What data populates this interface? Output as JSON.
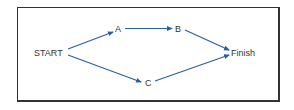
{
  "diagram": {
    "type": "network-flow",
    "edge_color": "#2a5da8",
    "text_color": "#333333",
    "border_color": "#333333",
    "nodes": [
      {
        "id": "start",
        "label": "START",
        "x": 34,
        "y": 55
      },
      {
        "id": "a",
        "label": "A",
        "x": 115,
        "y": 31
      },
      {
        "id": "b",
        "label": "B",
        "x": 175,
        "y": 31
      },
      {
        "id": "c",
        "label": "C",
        "x": 145,
        "y": 85
      },
      {
        "id": "finish",
        "label": "Finish",
        "x": 231,
        "y": 55
      }
    ],
    "edges": [
      {
        "from": "START",
        "to": "A"
      },
      {
        "from": "A",
        "to": "B"
      },
      {
        "from": "B",
        "to": "Finish"
      },
      {
        "from": "START",
        "to": "C"
      },
      {
        "from": "C",
        "to": "Finish"
      }
    ]
  }
}
